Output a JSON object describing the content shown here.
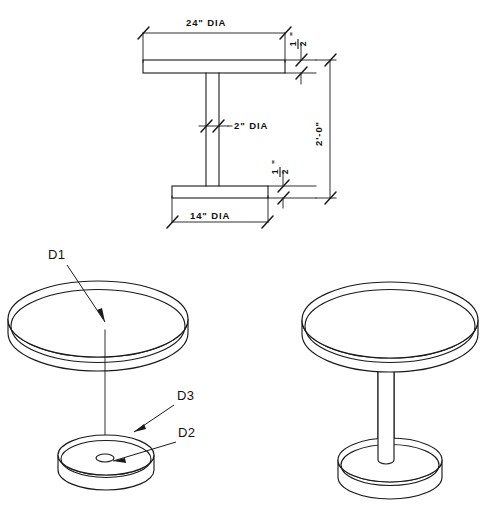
{
  "sheet": {
    "title": "Pedestal Table Shop Drawing",
    "background_color": "#ffffff",
    "line_color": "#1a1a1a"
  },
  "elevation_view": {
    "name": "front-elevation",
    "dimensions": [
      {
        "id": "top-diameter",
        "label": "24\" DIA",
        "value": 24,
        "unit": "in",
        "applies_to": "table-top-plate",
        "placement": "above"
      },
      {
        "id": "top-thickness",
        "label": "1/2",
        "numerator": "1",
        "denominator": "2",
        "suffix": "\"",
        "value": 0.5,
        "unit": "in",
        "applies_to": "table-top-plate",
        "placement": "right"
      },
      {
        "id": "column-diameter",
        "label": "2\" DIA",
        "value": 2,
        "unit": "in",
        "applies_to": "center-column",
        "placement": "middle-right"
      },
      {
        "id": "overall-height",
        "label": "2'-0\"",
        "value": 24,
        "unit": "in",
        "applies_to": "overall-assembly",
        "placement": "far-right",
        "rotated": true
      },
      {
        "id": "base-thickness",
        "label": "1/2",
        "numerator": "1",
        "denominator": "2",
        "suffix": "\"",
        "value": 0.5,
        "unit": "in",
        "applies_to": "base-plate",
        "placement": "right"
      },
      {
        "id": "base-diameter",
        "label": "14\" DIA",
        "value": 14,
        "unit": "in",
        "applies_to": "base-plate",
        "placement": "below"
      }
    ]
  },
  "exploded_view": {
    "name": "exploded-isometric",
    "callouts": [
      {
        "id": "D1",
        "label": "D1",
        "target": "table-top-disc",
        "text_x": 48,
        "text_y": 259
      },
      {
        "id": "D3",
        "label": "D3",
        "target": "base-disc-rim",
        "text_x": 177,
        "text_y": 400
      },
      {
        "id": "D2",
        "label": "D2",
        "target": "base-center-hole",
        "text_x": 178,
        "text_y": 437
      }
    ]
  },
  "assembly_view": {
    "name": "assembled-isometric",
    "parts": [
      "table-top-disc",
      "center-column",
      "base-disc"
    ]
  }
}
